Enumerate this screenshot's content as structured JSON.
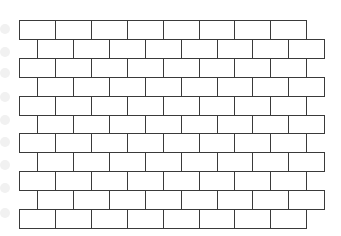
{
  "figure": {
    "rows": 11,
    "bricks_per_row": 8,
    "stroke_color": "#3a3a3a",
    "background_color": "#ffffff",
    "brick_width": 35.9,
    "row_height": 18.9,
    "origin_x": 19,
    "origin_y": 20,
    "offset_x": 18
  },
  "ghost_marks": {
    "color": "#f1f1f1",
    "y_positions": [
      24,
      47,
      68,
      92,
      115,
      137,
      160,
      183,
      208
    ]
  }
}
